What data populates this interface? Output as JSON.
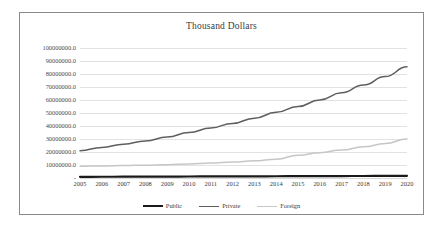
{
  "chart_data": {
    "type": "line",
    "title": "Thousand Dollars",
    "xlabel": "",
    "ylabel": "",
    "grid": true,
    "legend_position": "bottom",
    "ylim": [
      0,
      100000000
    ],
    "categories": [
      "2005",
      "2006",
      "2007",
      "2008",
      "2009",
      "2010",
      "2011",
      "2012",
      "2013",
      "2014",
      "2015",
      "2016",
      "2017",
      "2018",
      "2019",
      "2020"
    ],
    "ytick_labels": [
      "100000000.0",
      "90000000.0",
      "80000000.0",
      "70000000.0",
      "60000000.0",
      "50000000.0",
      "40000000.0",
      "30000000.0",
      "20000000.0",
      "10000000.0",
      "-"
    ],
    "ytick_values": [
      100000000,
      90000000,
      80000000,
      70000000,
      60000000,
      50000000,
      40000000,
      30000000,
      20000000,
      10000000,
      0
    ],
    "series": [
      {
        "name": "Public",
        "color": "#1a1a1a",
        "width": 2.2,
        "values": [
          900000,
          950000,
          1000000,
          1050000,
          1100000,
          1150000,
          1200000,
          1250000,
          1300000,
          1350000,
          1400000,
          1450000,
          1500000,
          1550000,
          1600000,
          1650000
        ]
      },
      {
        "name": "Private",
        "color": "#5f5f5f",
        "width": 1.5,
        "values": [
          21000000,
          23500000,
          26000000,
          28500000,
          31500000,
          35000000,
          38500000,
          42000000,
          46000000,
          50500000,
          55000000,
          60000000,
          65500000,
          71500000,
          78000000,
          85500000
        ]
      },
      {
        "name": "Foreign",
        "color": "#c6c6c6",
        "width": 1.5,
        "values": [
          9000000,
          9300000,
          9600000,
          9900000,
          10200000,
          10800000,
          11500000,
          12300000,
          13200000,
          14500000,
          17500000,
          19500000,
          21500000,
          24000000,
          26500000,
          30000000
        ]
      }
    ]
  }
}
